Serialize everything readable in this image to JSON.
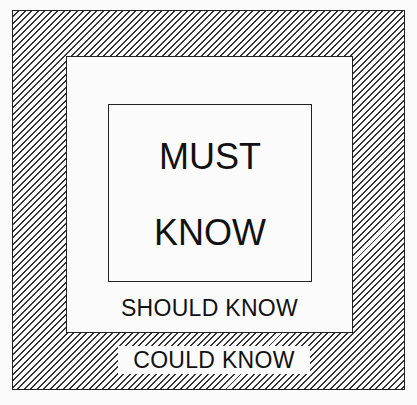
{
  "diagram": {
    "type": "nested-squares",
    "layers": [
      {
        "name": "outer",
        "label": "COULD KNOW",
        "fill": "diagonal-hatch"
      },
      {
        "name": "middle",
        "label": "SHOULD KNOW",
        "fill": "white"
      },
      {
        "name": "inner",
        "label_lines": [
          "MUST",
          "KNOW"
        ],
        "fill": "white"
      }
    ],
    "colors": {
      "line": "#222222",
      "background": "#fbfbfb"
    }
  }
}
